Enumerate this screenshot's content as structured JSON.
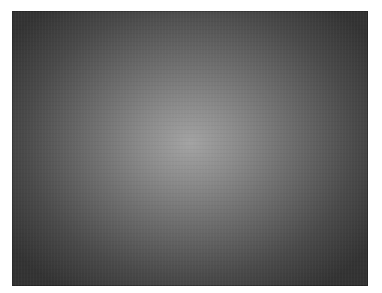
{
  "image": {
    "description": "Grayscale radial gradient photograph, lighter at center and darker toward corners",
    "colors": {
      "center": "#a3a3a3",
      "mid": "#6a6a6a",
      "edge": "#333333",
      "margin": "#ffffff"
    }
  },
  "edges": {
    "top_text": "",
    "bottom_text": ""
  }
}
